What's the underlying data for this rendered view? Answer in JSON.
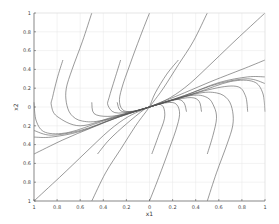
{
  "chart_data": {
    "type": "line",
    "title": "",
    "xlabel": "x1",
    "ylabel": "x2",
    "xlim": [
      -1,
      1
    ],
    "ylim": [
      -1,
      1
    ],
    "grid": true,
    "legend": null,
    "x_ticks": [
      -1,
      -0.8,
      -0.6,
      -0.4,
      -0.2,
      0,
      0.2,
      0.4,
      0.6,
      0.8,
      1
    ],
    "x_tick_labels": [
      "1",
      "0.8",
      "0.6",
      "0.4",
      "0.2",
      "0",
      "0.2",
      "0.4",
      "0.6",
      "0.8",
      "1"
    ],
    "y_ticks": [
      1,
      0.8,
      0.6,
      0.4,
      0.2,
      0,
      -0.2,
      -0.4,
      -0.6,
      -0.8,
      -1
    ],
    "y_tick_labels": [
      "1",
      "0.8",
      "0.6",
      "0.4",
      "0.2",
      "0",
      "0.2",
      "0.4",
      "0.6",
      "0.8",
      "1"
    ],
    "series": [
      {
        "name": "traj-1",
        "points": [
          [
            -0.5,
            1
          ],
          [
            -0.58,
            0.7
          ],
          [
            -0.67,
            0.4
          ],
          [
            -0.72,
            0.2
          ],
          [
            -0.72,
            0.05
          ],
          [
            -0.68,
            -0.08
          ],
          [
            -0.58,
            -0.15
          ],
          [
            -0.4,
            -0.14
          ],
          [
            0,
            0
          ]
        ]
      },
      {
        "name": "traj-2",
        "points": [
          [
            0,
            1
          ],
          [
            -0.08,
            0.75
          ],
          [
            -0.17,
            0.45
          ],
          [
            -0.24,
            0.2
          ],
          [
            -0.26,
            0.05
          ],
          [
            -0.22,
            -0.04
          ],
          [
            -0.12,
            -0.04
          ],
          [
            0,
            0
          ]
        ]
      },
      {
        "name": "traj-3",
        "points": [
          [
            0.5,
            1
          ],
          [
            0.38,
            0.7
          ],
          [
            0.25,
            0.45
          ],
          [
            0.12,
            0.2
          ],
          [
            0.03,
            0.05
          ],
          [
            0,
            0
          ]
        ]
      },
      {
        "name": "traj-4",
        "points": [
          [
            1,
            1
          ],
          [
            0.78,
            0.75
          ],
          [
            0.55,
            0.48
          ],
          [
            0.35,
            0.25
          ],
          [
            0.18,
            0.1
          ],
          [
            0,
            0
          ]
        ]
      },
      {
        "name": "traj-5",
        "points": [
          [
            -0.75,
            0.5
          ],
          [
            -0.8,
            0.3
          ],
          [
            -0.84,
            0.1
          ],
          [
            -0.85,
            0.02
          ],
          [
            -0.8,
            -0.1
          ],
          [
            -0.6,
            -0.2
          ],
          [
            -0.3,
            -0.1
          ],
          [
            0,
            0
          ]
        ]
      },
      {
        "name": "traj-6",
        "points": [
          [
            -0.25,
            0.5
          ],
          [
            -0.3,
            0.3
          ],
          [
            -0.35,
            0.1
          ],
          [
            -0.36,
            0.02
          ],
          [
            -0.3,
            -0.06
          ],
          [
            -0.15,
            -0.05
          ],
          [
            0,
            0
          ]
        ]
      },
      {
        "name": "traj-7",
        "points": [
          [
            0.25,
            0.5
          ],
          [
            0.15,
            0.35
          ],
          [
            0.05,
            0.15
          ],
          [
            0,
            0
          ]
        ]
      },
      {
        "name": "traj-8",
        "points": [
          [
            1,
            0.5
          ],
          [
            0.8,
            0.4
          ],
          [
            0.55,
            0.28
          ],
          [
            0.3,
            0.15
          ],
          [
            0,
            0
          ]
        ]
      },
      {
        "name": "traj-9",
        "points": [
          [
            -1,
            0.05
          ],
          [
            -0.98,
            -0.15
          ],
          [
            -0.9,
            -0.27
          ],
          [
            -0.7,
            -0.27
          ],
          [
            -0.4,
            -0.15
          ],
          [
            0,
            0
          ]
        ]
      },
      {
        "name": "traj-10",
        "points": [
          [
            -1,
            -0.25
          ],
          [
            -0.85,
            -0.3
          ],
          [
            -0.6,
            -0.25
          ],
          [
            -0.3,
            -0.12
          ],
          [
            0,
            0
          ]
        ]
      },
      {
        "name": "traj-11",
        "points": [
          [
            -1,
            -0.32
          ],
          [
            -0.85,
            -0.32
          ],
          [
            -0.6,
            -0.26
          ],
          [
            -0.3,
            -0.12
          ],
          [
            0,
            0
          ]
        ]
      },
      {
        "name": "traj-12",
        "points": [
          [
            -1,
            -0.5
          ],
          [
            -0.75,
            -0.35
          ],
          [
            -0.5,
            -0.22
          ],
          [
            -0.25,
            -0.1
          ],
          [
            0,
            0
          ]
        ]
      },
      {
        "name": "traj-13",
        "points": [
          [
            -1,
            -1
          ],
          [
            -0.78,
            -0.75
          ],
          [
            -0.55,
            -0.48
          ],
          [
            -0.35,
            -0.25
          ],
          [
            -0.18,
            -0.1
          ],
          [
            0,
            0
          ]
        ]
      },
      {
        "name": "traj-14",
        "points": [
          [
            -0.5,
            -1
          ],
          [
            -0.38,
            -0.7
          ],
          [
            -0.25,
            -0.45
          ],
          [
            -0.12,
            -0.2
          ],
          [
            -0.03,
            -0.05
          ],
          [
            0,
            0
          ]
        ]
      },
      {
        "name": "traj-15",
        "points": [
          [
            -0.45,
            -0.5
          ],
          [
            -0.35,
            -0.35
          ],
          [
            -0.2,
            -0.18
          ],
          [
            -0.05,
            -0.03
          ],
          [
            0,
            0
          ]
        ]
      },
      {
        "name": "traj-16",
        "points": [
          [
            0,
            -1
          ],
          [
            0.08,
            -0.75
          ],
          [
            0.17,
            -0.45
          ],
          [
            0.24,
            -0.2
          ],
          [
            0.26,
            -0.05
          ],
          [
            0.22,
            0.04
          ],
          [
            0.12,
            0.04
          ],
          [
            0,
            0
          ]
        ]
      },
      {
        "name": "traj-17",
        "points": [
          [
            0.02,
            -0.5
          ],
          [
            0.08,
            -0.3
          ],
          [
            0.13,
            -0.12
          ],
          [
            0.12,
            0.0
          ],
          [
            0.07,
            0.03
          ],
          [
            0,
            0
          ]
        ]
      },
      {
        "name": "traj-18",
        "points": [
          [
            0.5,
            -1
          ],
          [
            0.58,
            -0.7
          ],
          [
            0.67,
            -0.4
          ],
          [
            0.72,
            -0.2
          ],
          [
            0.72,
            -0.05
          ],
          [
            0.68,
            0.08
          ],
          [
            0.58,
            0.15
          ],
          [
            0.4,
            0.14
          ],
          [
            0,
            0
          ]
        ]
      },
      {
        "name": "traj-19",
        "points": [
          [
            0.5,
            -0.5
          ],
          [
            0.55,
            -0.3
          ],
          [
            0.58,
            -0.12
          ],
          [
            0.56,
            0.0
          ],
          [
            0.5,
            0.1
          ],
          [
            0.35,
            0.12
          ],
          [
            0,
            0
          ]
        ]
      },
      {
        "name": "traj-20",
        "points": [
          [
            1,
            -0.05
          ],
          [
            0.98,
            0.15
          ],
          [
            0.9,
            0.27
          ],
          [
            0.7,
            0.27
          ],
          [
            0.4,
            0.15
          ],
          [
            0,
            0
          ]
        ]
      },
      {
        "name": "traj-21",
        "points": [
          [
            0.32,
            -0.05
          ],
          [
            0.3,
            0.04
          ],
          [
            0.25,
            0.08
          ],
          [
            0.15,
            0.06
          ],
          [
            0,
            0
          ]
        ]
      },
      {
        "name": "traj-22",
        "points": [
          [
            0.45,
            -0.05
          ],
          [
            0.43,
            0.06
          ],
          [
            0.36,
            0.1
          ],
          [
            0.2,
            0.07
          ],
          [
            0,
            0
          ]
        ]
      },
      {
        "name": "traj-23",
        "points": [
          [
            0.85,
            -0.05
          ],
          [
            0.83,
            0.12
          ],
          [
            0.75,
            0.22
          ],
          [
            0.5,
            0.18
          ],
          [
            0,
            0
          ]
        ]
      },
      {
        "name": "traj-24",
        "points": [
          [
            1,
            0.25
          ],
          [
            0.85,
            0.3
          ],
          [
            0.6,
            0.25
          ],
          [
            0.3,
            0.12
          ],
          [
            0,
            0
          ]
        ]
      },
      {
        "name": "traj-25",
        "points": [
          [
            1,
            0.32
          ],
          [
            0.85,
            0.32
          ],
          [
            0.6,
            0.26
          ],
          [
            0.3,
            0.12
          ],
          [
            0,
            0
          ]
        ]
      },
      {
        "name": "traj-26",
        "points": [
          [
            -0.28,
            0.05
          ],
          [
            -0.25,
            -0.04
          ],
          [
            -0.15,
            -0.05
          ],
          [
            0,
            0
          ]
        ]
      },
      {
        "name": "traj-27",
        "points": [
          [
            -0.5,
            0.05
          ],
          [
            -0.48,
            -0.07
          ],
          [
            -0.36,
            -0.1
          ],
          [
            -0.2,
            -0.07
          ],
          [
            0,
            0
          ]
        ]
      }
    ]
  }
}
